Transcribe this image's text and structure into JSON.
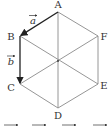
{
  "diagram": {
    "vertices": [
      {
        "name": "A",
        "x": 58,
        "y": 12,
        "label_x": 58,
        "label_y": 8
      },
      {
        "name": "B",
        "x": 20,
        "y": 36,
        "label_x": 11,
        "label_y": 40
      },
      {
        "name": "C",
        "x": 20,
        "y": 84,
        "label_x": 11,
        "label_y": 91
      },
      {
        "name": "D",
        "x": 58,
        "y": 108,
        "label_x": 58,
        "label_y": 119
      },
      {
        "name": "E",
        "x": 98,
        "y": 84,
        "label_x": 104,
        "label_y": 89
      },
      {
        "name": "F",
        "x": 98,
        "y": 36,
        "label_x": 104,
        "label_y": 40
      }
    ],
    "center": {
      "x": 58,
      "y": 61
    },
    "vectors": [
      {
        "name": "a",
        "from": "A",
        "to": "B",
        "label": "a",
        "label_x": 33,
        "label_y": 24
      },
      {
        "name": "b",
        "from": "B",
        "to": "C",
        "label": "b",
        "label_x": 11,
        "label_y": 64
      }
    ],
    "colors": {
      "edge": "#8a8a8a",
      "vector": "#222222",
      "label": "#333333"
    }
  }
}
